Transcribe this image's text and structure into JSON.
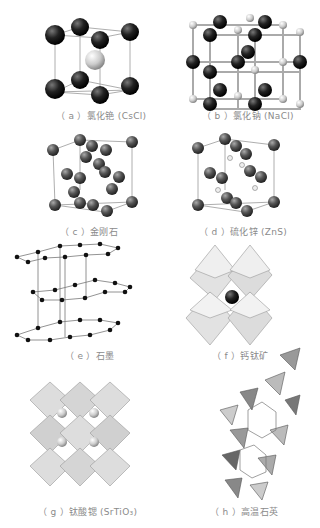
{
  "figure": {
    "panels": [
      {
        "id": "a",
        "label": "（ a ）",
        "name": "氯化铯",
        "formula": "(CsCl)",
        "structure": "body-centered cubic"
      },
      {
        "id": "b",
        "label": "（ b ）",
        "name": "氯化钠",
        "formula": "(NaCl)",
        "structure": "rock salt"
      },
      {
        "id": "c",
        "label": "（ c ）",
        "name": "金刚石",
        "formula": "",
        "structure": "diamond cubic"
      },
      {
        "id": "d",
        "label": "（ d ）",
        "name": "硫化锌",
        "formula": "(ZnS)",
        "structure": "zinc blende"
      },
      {
        "id": "e",
        "label": "（ e ）",
        "name": "石墨",
        "formula": "",
        "structure": "layered hexagonal"
      },
      {
        "id": "f",
        "label": "（ f ）",
        "name": "钙钛矿",
        "formula": "",
        "structure": "octahedral"
      },
      {
        "id": "g",
        "label": "（ g ）",
        "name": "钛酸锶",
        "formula": "(SrTiO₃)",
        "structure": "perovskite octahedra"
      },
      {
        "id": "h",
        "label": "（ h ）",
        "name": "高温石英",
        "formula": "",
        "structure": "tetrahedral framework"
      }
    ]
  },
  "colors": {
    "atom_dark": "#1a1a1a",
    "atom_light": "#d8d8d8",
    "bond": "#9a9a9a",
    "caption": "#8a8a8a",
    "poly_light": "#e4e4e4",
    "poly_mid": "#b8b8b8",
    "poly_dark": "#555555"
  }
}
